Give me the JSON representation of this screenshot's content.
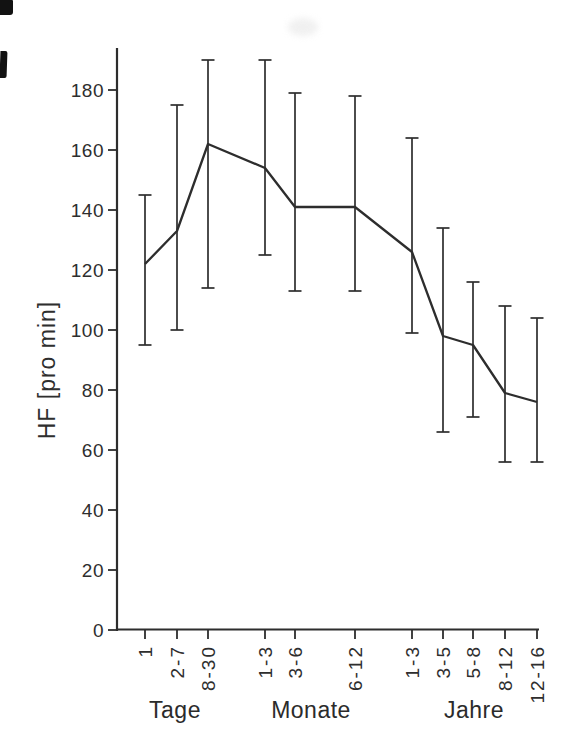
{
  "figure": {
    "colors": {
      "line": "#2d2d2d",
      "axis": "#2d2d2d",
      "text": "#2e2e2e",
      "background": "#ffffff",
      "scan_artifact": "#121212"
    }
  },
  "chart_data": {
    "type": "line",
    "title": "",
    "xlabel": "",
    "ylabel": "HF [pro min]",
    "ylim": [
      0,
      194
    ],
    "ytick_step": 20,
    "y_ticks": [
      0,
      20,
      40,
      60,
      80,
      100,
      120,
      140,
      160,
      180
    ],
    "grid": false,
    "legend": null,
    "error_bars": true,
    "categories": [
      "1",
      "2-7",
      "8-30",
      "1-3",
      "3-6",
      "6-12",
      "1-3",
      "3-5",
      "5-8",
      "8-12",
      "12-16"
    ],
    "category_groups": [
      {
        "label": "Tage",
        "categories": [
          "1",
          "2-7",
          "8-30"
        ]
      },
      {
        "label": "Monate",
        "categories": [
          "1-3",
          "3-6",
          "6-12"
        ]
      },
      {
        "label": "Jahre",
        "categories": [
          "1-3",
          "3-5",
          "5-8",
          "8-12",
          "12-16"
        ]
      }
    ],
    "series": [
      {
        "name": "HF",
        "values": [
          122,
          133,
          162,
          154,
          141,
          141,
          126,
          98,
          95,
          79,
          76
        ],
        "error_low": [
          95,
          100,
          114,
          125,
          113,
          113,
          99,
          66,
          71,
          56,
          56
        ],
        "error_high": [
          145,
          175,
          190,
          190,
          179,
          178,
          164,
          134,
          116,
          108,
          104
        ]
      }
    ]
  }
}
